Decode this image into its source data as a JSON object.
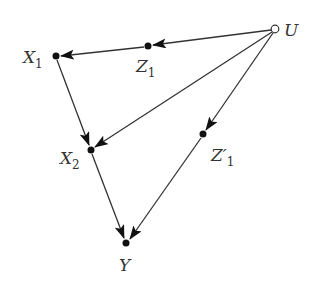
{
  "diagram": {
    "type": "causal-graph",
    "colors": {
      "edge": "#333333",
      "node_fill": "#111111",
      "background": "#ffffff"
    },
    "nodes": [
      {
        "id": "X1",
        "label": "X",
        "subscript": "1",
        "x": 56,
        "y": 56,
        "kind": "observed"
      },
      {
        "id": "Z1",
        "label": "Z",
        "subscript": "1",
        "x": 148,
        "y": 46,
        "kind": "observed"
      },
      {
        "id": "U",
        "label": "U",
        "subscript": "",
        "x": 275,
        "y": 29,
        "kind": "unobserved"
      },
      {
        "id": "X2",
        "label": "X",
        "subscript": "2",
        "x": 91,
        "y": 150,
        "kind": "observed"
      },
      {
        "id": "Z1p",
        "label": "Z′",
        "subscript": "1",
        "x": 203,
        "y": 134,
        "kind": "observed"
      },
      {
        "id": "Y",
        "label": "Y",
        "subscript": "",
        "x": 126,
        "y": 243,
        "kind": "observed"
      }
    ],
    "edges": [
      {
        "from": "U",
        "to": "Z1"
      },
      {
        "from": "Z1",
        "to": "X1"
      },
      {
        "from": "U",
        "to": "X2"
      },
      {
        "from": "U",
        "to": "Z1p"
      },
      {
        "from": "X1",
        "to": "X2"
      },
      {
        "from": "X2",
        "to": "Y"
      },
      {
        "from": "Z1p",
        "to": "Y"
      }
    ]
  }
}
